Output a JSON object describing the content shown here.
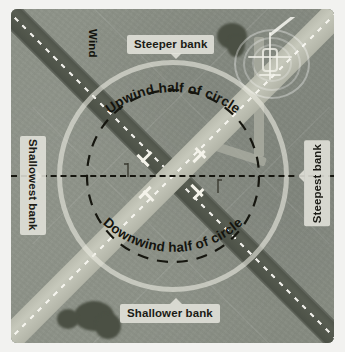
{
  "diagram": {
    "type": "annotated-aerial-diagram"
  },
  "colors": {
    "grass": "#8d9287",
    "dark_runway": "#4e5349",
    "light_runway": "#bcbeb1",
    "circle": "#e8e9de",
    "dashed_black": "#16160f",
    "label_bg": "#e2e2db",
    "label_text": "#1b1b15",
    "tree": "#4b5044",
    "page_bg": "#ffffff"
  },
  "labels": {
    "wind": "Wind",
    "steeper_bank": "Steeper bank",
    "shallower_bank": "Shallower bank",
    "shallowest_bank": "Shallowest bank",
    "steepest_bank": "Steepest bank",
    "upwind_half": "Upwind half of circle",
    "downwind_half": "Downwind half of circle"
  },
  "features": {
    "aircraft": "aircraft-icon",
    "runway_dark": "runway-northwest-southeast",
    "runway_light": "runway-northeast-southwest",
    "pattern_circle": "solid-pattern-circle",
    "inner_circle": "dashed-inner-circle",
    "axis": "dashed-horizontal-axis"
  }
}
